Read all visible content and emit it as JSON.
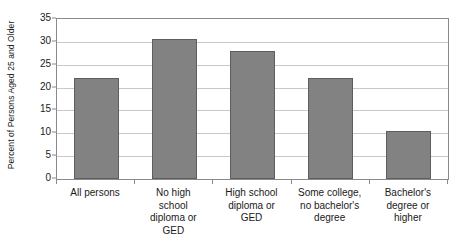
{
  "chart_data": {
    "type": "bar",
    "title": "",
    "subtitle": "",
    "xlabel": "",
    "ylabel": "Percent of Persons Aged 25 and Older",
    "categories": [
      "All persons",
      "No high school diploma or GED",
      "High school diploma or GED",
      "Some college, no bachelor's degree",
      "Bachelor's degree or higher"
    ],
    "category_lines": [
      [
        "All persons"
      ],
      [
        "No high",
        "school",
        "diploma or",
        "GED"
      ],
      [
        "High school",
        "diploma or",
        "GED"
      ],
      [
        "Some college,",
        "no bachelor's",
        "degree"
      ],
      [
        "Bachelor's",
        "degree or",
        "higher"
      ]
    ],
    "values": [
      22.0,
      30.7,
      28.0,
      22.0,
      10.5
    ],
    "ylim": [
      0,
      35
    ],
    "ytick_step": 5,
    "ytick_labels": [
      "0",
      "5",
      "10",
      "15",
      "20",
      "25",
      "30",
      "35"
    ],
    "grid": true,
    "grid_axis": "y",
    "legend": false,
    "legend_position": "none",
    "bar_color": "#828282",
    "bar_border_color": "#5e5e5e",
    "gridline_color": "#c8c8c8",
    "frame_color": "#8a8a8a",
    "background_color": "#ffffff",
    "text_color": "#1a1a1a"
  }
}
